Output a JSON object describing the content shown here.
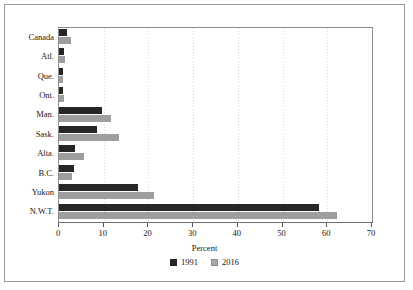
{
  "chart_data": {
    "type": "bar",
    "orientation": "horizontal",
    "title": "",
    "xlabel": "Percent",
    "ylabel": "",
    "xlim": [
      0,
      70
    ],
    "xticks": [
      0,
      10,
      20,
      30,
      40,
      50,
      60,
      70
    ],
    "grid": "vertical-dotted",
    "legend_position": "bottom",
    "categories": [
      "Canada",
      "Atl.",
      "Que.",
      "Ont.",
      "Man.",
      "Sask.",
      "Alta.",
      "B.C.",
      "Yukon",
      "N.W.T."
    ],
    "series": [
      {
        "name": "1991",
        "color": "#262626",
        "values": [
          1.8,
          1.1,
          1.0,
          1.0,
          9.6,
          8.6,
          3.6,
          3.3,
          17.6,
          58.2
        ]
      },
      {
        "name": "2016",
        "color": "#9e9e9e",
        "values": [
          2.6,
          1.4,
          0.8,
          1.1,
          11.6,
          13.4,
          5.5,
          3.0,
          21.3,
          62.2
        ]
      }
    ]
  },
  "axis": {
    "x_title": "Percent",
    "tick_labels": [
      "0",
      "10",
      "20",
      "30",
      "40",
      "50",
      "60",
      "70"
    ]
  },
  "legend": {
    "items": [
      {
        "label": "1991",
        "swatch": "dark-square-swatch"
      },
      {
        "label": "2016",
        "swatch": "light-square-swatch"
      }
    ]
  }
}
